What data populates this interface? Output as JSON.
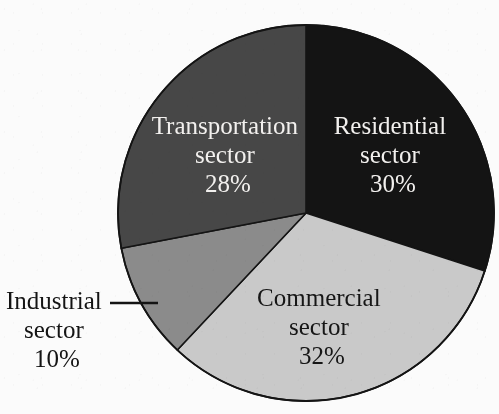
{
  "chart_data": {
    "type": "pie",
    "title": "",
    "subtitle": "",
    "xlabel": "",
    "ylabel": "",
    "grid": false,
    "legend_position": "none",
    "label_style": "inside-slice-with-one-callout",
    "units": "percent",
    "total": 100,
    "start_angle_deg": 0,
    "direction": "clockwise",
    "categories": [
      "Residential sector",
      "Commercial sector",
      "Industrial sector",
      "Transportation sector"
    ],
    "values": [
      30,
      32,
      10,
      28
    ],
    "slices": [
      {
        "id": "residential",
        "name_line1": "Residential",
        "name_line2": "sector",
        "value": 30,
        "value_label": "30%",
        "fill": "#141414",
        "text_color": "#f2f0ee",
        "label_placement": "inside",
        "start_deg": 0,
        "end_deg": 108
      },
      {
        "id": "commercial",
        "name_line1": "Commercial",
        "name_line2": "sector",
        "value": 32,
        "value_label": "32%",
        "fill": "#c9c9c9",
        "text_color": "#161616",
        "label_placement": "inside",
        "start_deg": 108,
        "end_deg": 223.2
      },
      {
        "id": "industrial",
        "name_line1": "Industrial",
        "name_line2": "sector",
        "value": 10,
        "value_label": "10%",
        "fill": "#8b8b8b",
        "text_color": "#141414",
        "label_placement": "callout-left",
        "start_deg": 223.2,
        "end_deg": 259.2
      },
      {
        "id": "transportation",
        "name_line1": "Transportation",
        "name_line2": "sector",
        "value": 28,
        "value_label": "28%",
        "fill": "#474747",
        "text_color": "#f2f0ee",
        "label_placement": "inside",
        "start_deg": 259.2,
        "end_deg": 360
      }
    ],
    "geometry": {
      "center_x": 306,
      "center_y": 213,
      "radius": 188,
      "outline_color": "#141414",
      "background": "#fbfbfb"
    }
  }
}
